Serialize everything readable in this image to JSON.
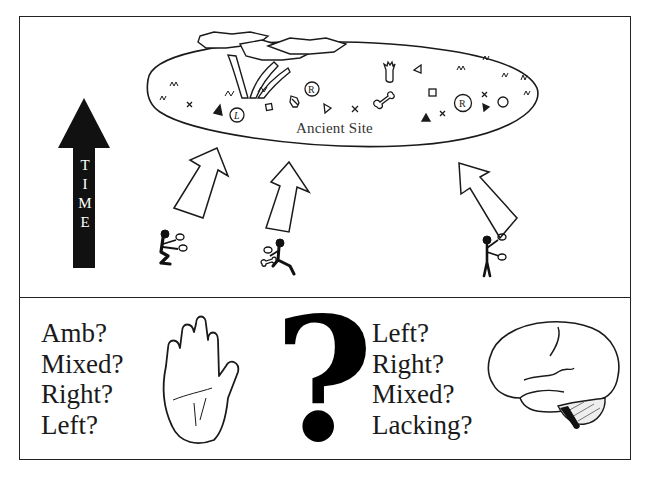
{
  "figure": {
    "top_panel": {
      "site_label": "Ancient Site",
      "time_arrow": {
        "label": "TIME",
        "letters": [
          "T",
          "I",
          "M",
          "E"
        ]
      },
      "site_symbols": [
        "x",
        "triangle-filled",
        "L-circle",
        "square",
        "bead",
        "R-circle",
        "triangle-open",
        "x",
        "bone",
        "tooth",
        "triangle-open",
        "square",
        "triangle-filled",
        "x",
        "R-circle",
        "x",
        "triangle-filled",
        "circle"
      ],
      "figures": [
        {
          "pose": "crouching",
          "arrow": "up-right"
        },
        {
          "pose": "kneeling",
          "arrow": "up"
        },
        {
          "pose": "standing",
          "arrow": "up-left"
        }
      ]
    },
    "bottom_panel": {
      "hand_options": [
        "Amb?",
        "Mixed?",
        "Right?",
        "Left?"
      ],
      "center_symbol": "?",
      "brain_options": [
        "Left?",
        "Right?",
        "Mixed?",
        "Lacking?"
      ]
    },
    "colors": {
      "ink": "#1a1a1a",
      "background": "#ffffff"
    }
  }
}
